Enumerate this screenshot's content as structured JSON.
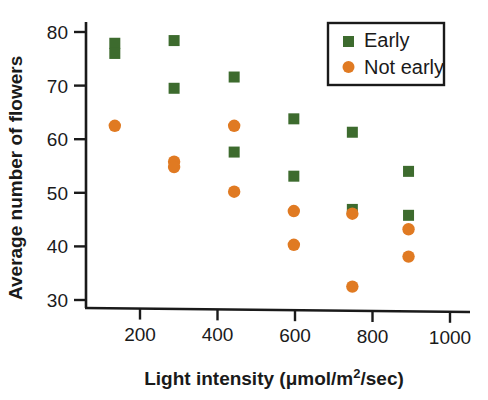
{
  "chart_data": {
    "type": "scatter",
    "title": "",
    "xlabel": "Light intensity (μmol/m²/sec)",
    "xlabel_main": "Light intensity (μmol/m",
    "xlabel_sup": "2",
    "xlabel_tail": "/sec)",
    "ylabel": "Average number of flowers",
    "xlim": [
      60,
      1060
    ],
    "ylim": [
      26,
      84
    ],
    "xticks": [
      200,
      400,
      600,
      800,
      1000
    ],
    "xtick_labels": [
      "200",
      "400",
      "600",
      "800",
      "1000"
    ],
    "yticks": [
      30,
      40,
      50,
      60,
      70,
      80
    ],
    "ytick_labels": [
      "30",
      "40",
      "50",
      "60",
      "70",
      "80"
    ],
    "grid": false,
    "legend_position": "top-right",
    "series": [
      {
        "name": "Early",
        "marker": "square",
        "color": "#3d6b2e",
        "points": [
          {
            "x": 135,
            "y": 77.9
          },
          {
            "x": 135,
            "y": 76.0
          },
          {
            "x": 288,
            "y": 78.4
          },
          {
            "x": 288,
            "y": 69.5
          },
          {
            "x": 443,
            "y": 71.6
          },
          {
            "x": 443,
            "y": 57.6
          },
          {
            "x": 597,
            "y": 63.8
          },
          {
            "x": 597,
            "y": 53.1
          },
          {
            "x": 748,
            "y": 61.3
          },
          {
            "x": 748,
            "y": 46.9
          },
          {
            "x": 893,
            "y": 54.0
          },
          {
            "x": 893,
            "y": 45.8
          }
        ]
      },
      {
        "name": "Not early",
        "marker": "circle",
        "color": "#e07a22",
        "points": [
          {
            "x": 135,
            "y": 62.5
          },
          {
            "x": 288,
            "y": 55.8
          },
          {
            "x": 288,
            "y": 54.8
          },
          {
            "x": 443,
            "y": 62.5
          },
          {
            "x": 443,
            "y": 50.2
          },
          {
            "x": 597,
            "y": 46.6
          },
          {
            "x": 597,
            "y": 40.3
          },
          {
            "x": 748,
            "y": 46.1
          },
          {
            "x": 748,
            "y": 32.5
          },
          {
            "x": 893,
            "y": 43.2
          },
          {
            "x": 893,
            "y": 38.1
          }
        ]
      }
    ],
    "legend": [
      {
        "label": "Early",
        "marker": "square",
        "color": "#3d6b2e"
      },
      {
        "label": "Not early",
        "marker": "circle",
        "color": "#e07a22"
      }
    ],
    "colors": {
      "early": "#3d6b2e",
      "not_early": "#e07a22",
      "axis": "#1a1a1a",
      "background": "#ffffff"
    }
  }
}
